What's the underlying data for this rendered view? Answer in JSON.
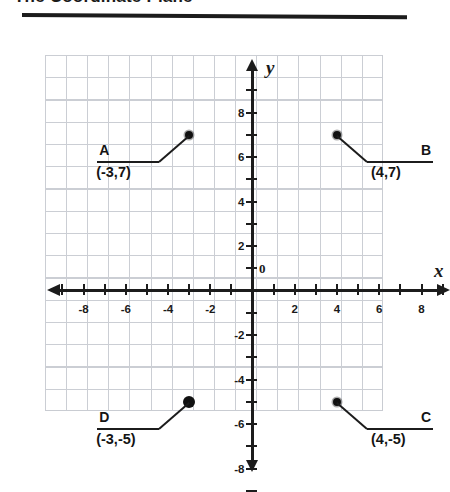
{
  "title": "The Coordinate Plane",
  "chart_data": {
    "type": "scatter",
    "title": "The Coordinate Plane",
    "xlabel": "x",
    "ylabel": "y",
    "origin_label": "0",
    "grid": true,
    "xlim": [
      -9,
      9
    ],
    "ylim": [
      -9,
      9
    ],
    "x_tick_labels": [
      "-8",
      "-6",
      "-4",
      "-2",
      "2",
      "4",
      "6",
      "8"
    ],
    "x_tick_values": [
      -8,
      -6,
      -4,
      -2,
      2,
      4,
      6,
      8
    ],
    "y_tick_labels": [
      "8",
      "6",
      "4",
      "2",
      "-2",
      "-4",
      "-6",
      "-8"
    ],
    "y_tick_values": [
      8,
      6,
      4,
      2,
      -2,
      -4,
      -6,
      -8
    ],
    "minor_tick_step": 1,
    "points": [
      {
        "name": "A",
        "coord_label": "(-3,7)",
        "x": -3,
        "y": 7,
        "marker": "small",
        "label_side": "left"
      },
      {
        "name": "B",
        "coord_label": "(4,7)",
        "x": 4,
        "y": 7,
        "marker": "small",
        "label_side": "right"
      },
      {
        "name": "C",
        "coord_label": "(4,-5)",
        "x": 4,
        "y": -5,
        "marker": "small",
        "label_side": "right"
      },
      {
        "name": "D",
        "coord_label": "(-3,-5)",
        "x": -3,
        "y": -5,
        "marker": "large",
        "label_side": "left"
      }
    ]
  }
}
